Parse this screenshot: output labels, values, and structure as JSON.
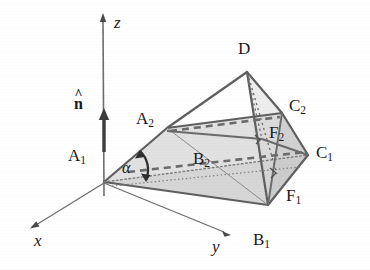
{
  "figure": {
    "type": "3d-geometry-diagram",
    "background_color": "#ffffff",
    "stroke_color": "#5a5a5a",
    "fill_color": "#c9c9c9",
    "text_color": "#1b1b1b"
  },
  "axes": {
    "origin_label": "A",
    "items": [
      {
        "name": "x-axis",
        "label": "x",
        "label_x": 34,
        "label_y": 232
      },
      {
        "name": "y-axis",
        "label": "y",
        "label_x": 212,
        "label_y": 238
      },
      {
        "name": "z-axis",
        "label": "z",
        "label_x": 114,
        "label_y": 14
      }
    ]
  },
  "vectors": [
    {
      "name": "normal-vector",
      "label": "n",
      "accent": "^",
      "label_x": 74,
      "label_y": 96
    }
  ],
  "angles": [
    {
      "name": "alpha-angle",
      "label": "α",
      "label_x": 122,
      "label_y": 160
    }
  ],
  "vertices": [
    {
      "name": "vertex-A1",
      "base": "A",
      "sub": "1",
      "label_x": 68,
      "label_y": 147
    },
    {
      "name": "vertex-A2",
      "base": "A",
      "sub": "2",
      "label_x": 136,
      "label_y": 110
    },
    {
      "name": "vertex-B1",
      "base": "B",
      "sub": "1",
      "label_x": 253,
      "label_y": 231
    },
    {
      "name": "vertex-B2",
      "base": "B",
      "sub": "2",
      "label_x": 193,
      "label_y": 150
    },
    {
      "name": "vertex-C1",
      "base": "C",
      "sub": "1",
      "label_x": 316,
      "label_y": 144
    },
    {
      "name": "vertex-C2",
      "base": "C",
      "sub": "2",
      "label_x": 289,
      "label_y": 97
    },
    {
      "name": "vertex-D",
      "base": "D",
      "sub": "",
      "label_x": 238,
      "label_y": 40
    },
    {
      "name": "vertex-F1",
      "base": "F",
      "sub": "1",
      "label_x": 286,
      "label_y": 187
    },
    {
      "name": "vertex-F2",
      "base": "F",
      "sub": "2",
      "label_x": 269,
      "label_y": 124
    }
  ],
  "geometry_points": {
    "A1": [
      104,
      182
    ],
    "A2": [
      167,
      128
    ],
    "B1": [
      268,
      205
    ],
    "B2": [
      232,
      151
    ],
    "C1": [
      308,
      155
    ],
    "C2": [
      282,
      113
    ],
    "D": [
      247,
      72
    ],
    "F1": [
      277,
      174
    ],
    "F2": [
      262,
      139
    ],
    "z_tip": [
      103,
      14
    ],
    "z_base": [
      104,
      196
    ],
    "x_tip": [
      31,
      227
    ],
    "y_tip": [
      229,
      235
    ],
    "n_tip": [
      104,
      110
    ],
    "n_base": [
      104,
      150
    ]
  }
}
